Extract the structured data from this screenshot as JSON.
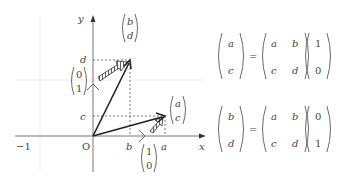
{
  "diagram": {
    "axes": {
      "x_label": "x",
      "y_label": "y",
      "origin_label": "O",
      "neg_one_label": "−1",
      "tick_b": "b",
      "tick_a": "a",
      "tick_c": "c",
      "tick_d": "d"
    },
    "vectors": {
      "ac": {
        "top": "a",
        "bottom": "c"
      },
      "bd": {
        "top": "b",
        "bottom": "d"
      },
      "e1": {
        "top": "1",
        "bottom": "0"
      },
      "e2": {
        "top": "0",
        "bottom": "1"
      }
    },
    "equations": [
      {
        "lhs": {
          "top": "a",
          "bottom": "c"
        },
        "eq": "=",
        "matrix": {
          "r1c1": "a",
          "r1c2": "b",
          "r2c1": "c",
          "r2c2": "d"
        },
        "vec": {
          "top": "1",
          "bottom": "0"
        }
      },
      {
        "lhs": {
          "top": "b",
          "bottom": "d"
        },
        "eq": "=",
        "matrix": {
          "r1c1": "a",
          "r1c2": "b",
          "r2c1": "c",
          "r2c2": "d"
        },
        "vec": {
          "top": "0",
          "bottom": "1"
        }
      }
    ],
    "colors": {
      "axis": "#777777",
      "vector": "#222222",
      "grid": "#eeeeee",
      "text": "#444444"
    }
  }
}
